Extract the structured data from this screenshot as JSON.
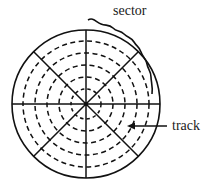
{
  "diagram": {
    "labels": {
      "sector": "sector",
      "track": "track"
    },
    "disk": {
      "center": [
        86,
        104
      ],
      "outer_radius": 74,
      "track_radii": [
        63,
        51,
        39,
        27,
        15
      ],
      "sector_count": 8
    },
    "colors": {
      "line": "#111111",
      "background": "#ffffff"
    }
  }
}
